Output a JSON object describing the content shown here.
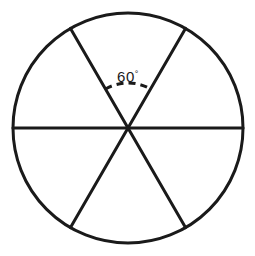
{
  "figure": {
    "name": "circle-divided-into-six-sectors",
    "background_color": "#ffffff",
    "stroke_color": "#1a1a1a",
    "circle": {
      "center_x": 128,
      "center_y": 128,
      "radius": 115,
      "stroke_width": 3
    },
    "diameters": [
      {
        "name": "horizontal-diameter",
        "angle_deg": 0,
        "stroke_width": 3
      },
      {
        "name": "diagonal-diameter-upper-left-to-lower-right",
        "angle_deg": 60,
        "stroke_width": 3
      },
      {
        "name": "diagonal-diameter-upper-right-to-lower-left",
        "angle_deg": 120,
        "stroke_width": 3
      }
    ],
    "sector_count": 6,
    "sector_angle_deg": 60,
    "angle_marker": {
      "label": "60",
      "degree_symbol": "°",
      "full_label": "60°",
      "arc_style": "dashed",
      "arc_radius": 45,
      "arc_start_angle_deg": 60,
      "arc_end_angle_deg": 120,
      "dash_pattern": "7 5",
      "stroke_width": 3,
      "label_x": 128,
      "label_y": 82
    }
  }
}
